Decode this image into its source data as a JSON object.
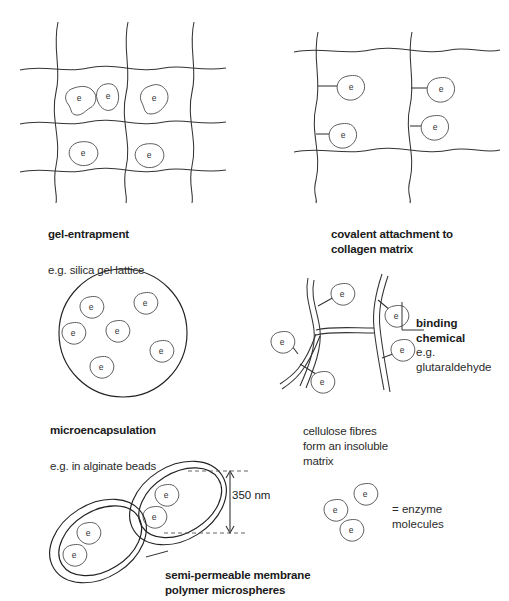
{
  "figure": {
    "enzyme_glyph_letter": "e"
  },
  "panels": {
    "gel_entrapment": {
      "title": "gel-entrapment",
      "subtitle": "e.g. silica gel lattice",
      "enzyme_count": 5
    },
    "covalent_attachment": {
      "title": "covalent attachment to\ncollagen matrix",
      "enzyme_count": 4
    },
    "microencapsulation": {
      "title": "microencapsulation",
      "subtitle": "e.g. in alginate beads",
      "enzyme_count": 6
    },
    "cellulose_matrix": {
      "caption": "cellulose fibres\nform an insoluble\nmatrix",
      "callout_title": "binding\nchemical",
      "callout_subtitle": "e.g.\nglutaraldehyde",
      "enzyme_count": 5
    },
    "microspheres": {
      "title": "semi-permeable membrane\npolymer microspheres",
      "dimension_label": "350 nm",
      "sphere_count": 2,
      "enzymes_per_sphere": 2
    }
  },
  "legend": {
    "text": "= enzyme\nmolecules",
    "enzyme_count": 3
  },
  "colors": {
    "background": "#ffffff",
    "ink": "#333333",
    "text": "#1a1a1a"
  }
}
